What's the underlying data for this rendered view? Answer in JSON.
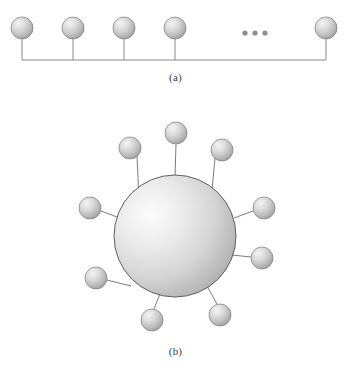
{
  "figure": {
    "width": 351,
    "height": 377,
    "background_color": "#ffffff",
    "panels": [
      {
        "id": "a",
        "caption": "(a)",
        "caption_x": 175,
        "caption_y": 78,
        "description": "linear-chain of spheres on a baseline with ellipsis",
        "baseline": {
          "y": 60,
          "x_start": 22,
          "x_end": 326,
          "color": "#8a8a8a",
          "width": 1
        },
        "spheres": [
          {
            "cx": 22,
            "cy": 28,
            "r": 11
          },
          {
            "cx": 73,
            "cy": 28,
            "r": 11
          },
          {
            "cx": 124,
            "cy": 28,
            "r": 11
          },
          {
            "cx": 175,
            "cy": 28,
            "r": 11
          },
          {
            "cx": 326,
            "cy": 28,
            "r": 11
          }
        ],
        "stems": [
          {
            "x": 22,
            "y1": 39,
            "y2": 60
          },
          {
            "x": 73,
            "y1": 39,
            "y2": 60
          },
          {
            "x": 124,
            "y1": 39,
            "y2": 60
          },
          {
            "x": 175,
            "y1": 39,
            "y2": 60
          },
          {
            "x": 326,
            "y1": 39,
            "y2": 60
          }
        ],
        "ellipsis": {
          "label": "...",
          "dots": [
            {
              "cx": 245,
              "cy": 33,
              "r": 2.6
            },
            {
              "cx": 255,
              "cy": 33,
              "r": 2.6
            },
            {
              "cx": 265,
              "cy": 33,
              "r": 2.6
            }
          ]
        }
      },
      {
        "id": "b",
        "caption": "(b)",
        "caption_x": 176,
        "caption_y": 352,
        "description": "large central sphere with ten satellite spheres radiating outward",
        "core": {
          "cx": 175,
          "cy": 236,
          "r": 61
        },
        "satellites": [
          {
            "cx": 176,
            "cy": 133,
            "r": 11,
            "link_angle_deg": -90
          },
          {
            "cx": 130,
            "cy": 148,
            "r": 11,
            "link_angle_deg": -126
          },
          {
            "cx": 222,
            "cy": 150,
            "r": 11,
            "link_angle_deg": -54
          },
          {
            "cx": 90,
            "cy": 208,
            "r": 11,
            "link_angle_deg": -162
          },
          {
            "cx": 264,
            "cy": 208,
            "r": 11,
            "link_angle_deg": -18
          },
          {
            "cx": 96,
            "cy": 278,
            "r": 11,
            "link_angle_deg": 150
          },
          {
            "cx": 262,
            "cy": 258,
            "r": 11,
            "link_angle_deg": 18
          },
          {
            "cx": 152,
            "cy": 320,
            "r": 11,
            "link_angle_deg": 105
          },
          {
            "cx": 220,
            "cy": 315,
            "r": 11,
            "link_angle_deg": 66
          },
          {
            "cx": 252,
            "cy": 300,
            "r": 0,
            "link_angle_deg": 40
          }
        ],
        "link_color": "#7d7d7d",
        "link_width": 1
      }
    ],
    "colors": {
      "sphere_light": "#f2f2f2",
      "sphere_mid": "#c9c9c9",
      "sphere_dark": "#9a9a9a",
      "sphere_edge": "#6e6e6e",
      "core_light": "#fbfbfb",
      "core_mid": "#d2d2d2",
      "core_dark": "#9e9e9e",
      "core_edge": "#5f5f5f",
      "line": "#8a8a8a",
      "caption_text": "#3a3a3a"
    }
  }
}
